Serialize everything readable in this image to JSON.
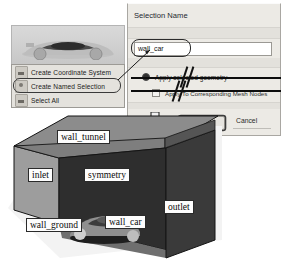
{
  "viewport": {
    "name": "car-geometry-preview"
  },
  "context_menu": {
    "items": [
      {
        "label": "Create Coordinate System",
        "icon": "coordinate-system-icon"
      },
      {
        "label": "Create Named Selection",
        "icon": "named-selection-icon"
      },
      {
        "label": "Select All",
        "icon": "select-all-icon"
      }
    ],
    "highlighted_index": 1
  },
  "dialog": {
    "title": "Selection Name",
    "input": {
      "value": "wall_car",
      "placeholder": "Selection Name"
    },
    "radio": {
      "label": "Apply selected geometry",
      "checked": true
    },
    "checkbox": {
      "label": "Apply To Corresponding Mesh Nodes",
      "checked": false
    },
    "buttons": {
      "ok": "OK",
      "cancel": "Cancel"
    }
  },
  "arrow": {
    "name": "down-arrow",
    "direction": "down"
  },
  "model": {
    "name": "wind-tunnel-named-selections",
    "labels": [
      {
        "text": "wall_tunnel",
        "face": "top"
      },
      {
        "text": "inlet",
        "face": "left"
      },
      {
        "text": "symmetry",
        "face": "interior"
      },
      {
        "text": "outlet",
        "face": "right"
      },
      {
        "text": "wall_ground",
        "face": "bottom"
      },
      {
        "text": "wall_car",
        "face": "car"
      }
    ],
    "colors": {
      "top": "#8c8c8c",
      "inlet": "#9a9a9a",
      "symmetry": "#2e2e2e",
      "outlet": "#3a3a3a",
      "ground": "#efefef",
      "edge": "#111111"
    }
  }
}
